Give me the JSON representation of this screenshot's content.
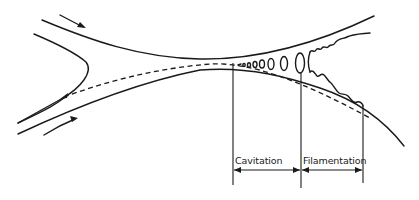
{
  "figure": {
    "type": "schematic of fluid flow between two converging/diverging surfaces",
    "labels": {
      "cavitation": "Cavitation",
      "filamentation": "Filamentation"
    },
    "regions": [
      {
        "name": "Cavitation",
        "x_start": 234,
        "x_end": 301
      },
      {
        "name": "Filamentation",
        "x_start": 301,
        "x_end": 363
      }
    ],
    "flow_arrows": 2,
    "colors": {
      "ink": "#1a1a1a",
      "background": "#ffffff"
    }
  }
}
